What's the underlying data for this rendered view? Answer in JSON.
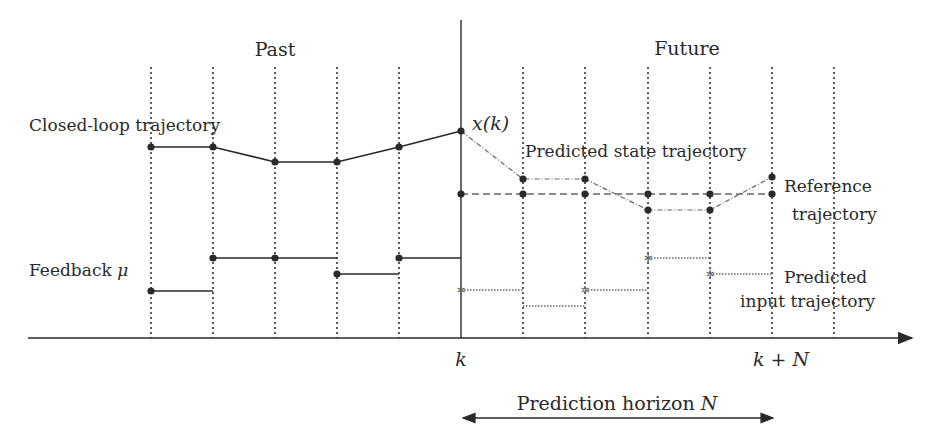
{
  "labels": {
    "past": "Past",
    "future": "Future",
    "closed_loop": "Closed-loop trajectory",
    "feedback": "Feedback",
    "feedback_symbol": "μ",
    "xk": "x(k)",
    "predicted_state": "Predicted state trajectory",
    "reference_line1": "Reference",
    "reference_line2": "trajectory",
    "predicted_input_line1": "Predicted",
    "predicted_input_line2": "input trajectory",
    "tick_k": "k",
    "tick_kN": "k + N",
    "horizon_text": "Prediction horizon",
    "horizon_symbol": "N"
  },
  "colors": {
    "ink": "#2a2a2a",
    "grid": "#333333",
    "predicted": "#666666"
  },
  "geometry": {
    "grid_x": [
      151,
      213,
      275,
      337,
      399,
      523,
      585,
      648,
      710,
      772,
      834
    ],
    "now_x": 461,
    "axis_y": 338,
    "grid_top": 67
  },
  "series": {
    "closed_loop": [
      [
        151,
        147
      ],
      [
        213,
        147
      ],
      [
        275,
        162
      ],
      [
        337,
        162
      ],
      [
        399,
        147
      ],
      [
        461,
        131
      ]
    ],
    "predicted_state": [
      [
        461,
        131
      ],
      [
        523,
        179
      ],
      [
        585,
        179
      ],
      [
        648,
        210
      ],
      [
        710,
        210
      ],
      [
        772,
        177
      ]
    ],
    "reference": [
      [
        461,
        194
      ],
      [
        523,
        194
      ],
      [
        585,
        194
      ],
      [
        648,
        194
      ],
      [
        710,
        194
      ],
      [
        772,
        194
      ]
    ],
    "feedback": [
      [
        151,
        213,
        291
      ],
      [
        213,
        337,
        258
      ],
      [
        337,
        399,
        274
      ],
      [
        399,
        461,
        258
      ]
    ],
    "feedback_dots": [
      [
        151,
        291
      ],
      [
        213,
        258
      ],
      [
        275,
        258
      ],
      [
        337,
        274
      ],
      [
        399,
        258
      ]
    ],
    "predicted_input": [
      [
        461,
        523,
        290
      ],
      [
        523,
        585,
        306
      ],
      [
        585,
        648,
        290
      ],
      [
        648,
        710,
        258
      ],
      [
        710,
        772,
        274
      ]
    ],
    "predicted_input_marks": [
      [
        461,
        290
      ],
      [
        585,
        290
      ],
      [
        648,
        258
      ],
      [
        710,
        274
      ]
    ]
  }
}
